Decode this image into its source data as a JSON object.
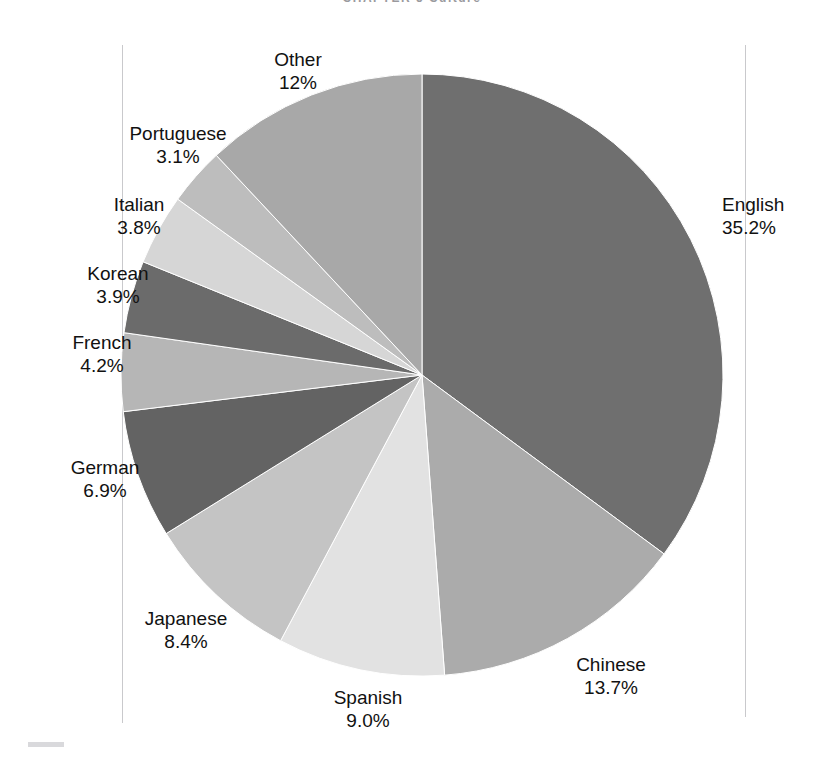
{
  "page": {
    "running_head": "CHAPTER 5   Culture",
    "background": "#ffffff"
  },
  "chart_data": {
    "type": "pie",
    "title": "",
    "subtitle": "",
    "xlabel": "",
    "ylabel": "",
    "legend_position": "callout-labels",
    "grid": false,
    "start_angle_deg": 0,
    "direction": "clockwise",
    "units": "percent",
    "categories": [
      "English",
      "Chinese",
      "Spanish",
      "Japanese",
      "German",
      "French",
      "Korean",
      "Italian",
      "Portuguese",
      "Other"
    ],
    "values": [
      35.2,
      13.7,
      9.0,
      8.4,
      6.9,
      4.2,
      3.9,
      3.8,
      3.1,
      12.0
    ],
    "value_labels": [
      "35.2%",
      "13.7%",
      "9.0%",
      "8.4%",
      "6.9%",
      "4.2%",
      "3.9%",
      "3.8%",
      "3.1%",
      "12%"
    ],
    "colors": [
      "#6f6f6f",
      "#ababab",
      "#e2e2e2",
      "#c4c4c4",
      "#636363",
      "#b6b6b6",
      "#6b6b6b",
      "#d6d6d6",
      "#bdbdbd",
      "#a8a8a8"
    ],
    "slices": [
      {
        "name": "English",
        "value": 35.2,
        "value_label": "35.2%",
        "color": "#6f6f6f"
      },
      {
        "name": "Chinese",
        "value": 13.7,
        "value_label": "13.7%",
        "color": "#ababab"
      },
      {
        "name": "Spanish",
        "value": 9.0,
        "value_label": "9.0%",
        "color": "#e2e2e2"
      },
      {
        "name": "Japanese",
        "value": 8.4,
        "value_label": "8.4%",
        "color": "#c4c4c4"
      },
      {
        "name": "German",
        "value": 6.9,
        "value_label": "6.9%",
        "color": "#636363"
      },
      {
        "name": "French",
        "value": 4.2,
        "value_label": "4.2%",
        "color": "#b6b6b6"
      },
      {
        "name": "Korean",
        "value": 3.9,
        "value_label": "3.9%",
        "color": "#6b6b6b"
      },
      {
        "name": "Italian",
        "value": 3.8,
        "value_label": "3.8%",
        "color": "#d6d6d6"
      },
      {
        "name": "Portuguese",
        "value": 3.1,
        "value_label": "3.1%",
        "color": "#bdbdbd"
      },
      {
        "name": "Other",
        "value": 12.0,
        "value_label": "12%",
        "color": "#a8a8a8"
      }
    ]
  },
  "labels": [
    {
      "key": "other",
      "name": "Other",
      "pct": "12%",
      "x": 298,
      "y": 48,
      "align": "align-center"
    },
    {
      "key": "portuguese",
      "name": "Portuguese",
      "pct": "3.1%",
      "x": 178,
      "y": 122,
      "align": "align-center"
    },
    {
      "key": "italian",
      "name": "Italian",
      "pct": "3.8%",
      "x": 139,
      "y": 193,
      "align": "align-center"
    },
    {
      "key": "korean",
      "name": "Korean",
      "pct": "3.9%",
      "x": 118,
      "y": 262,
      "align": "align-center"
    },
    {
      "key": "french",
      "name": "French",
      "pct": "4.2%",
      "x": 102,
      "y": 331,
      "align": "align-center"
    },
    {
      "key": "german",
      "name": "German",
      "pct": "6.9%",
      "x": 105,
      "y": 456,
      "align": "align-center"
    },
    {
      "key": "japanese",
      "name": "Japanese",
      "pct": "8.4%",
      "x": 186,
      "y": 607,
      "align": "align-center"
    },
    {
      "key": "spanish",
      "name": "Spanish",
      "pct": "9.0%",
      "x": 368,
      "y": 686,
      "align": "align-center"
    },
    {
      "key": "chinese",
      "name": "Chinese",
      "pct": "13.7%",
      "x": 611,
      "y": 653,
      "align": "align-center"
    },
    {
      "key": "english",
      "name": "English",
      "pct": "35.2%",
      "x": 722,
      "y": 193,
      "align": "align-left"
    }
  ],
  "geometry": {
    "cx": 422,
    "cy": 375,
    "r": 301
  }
}
